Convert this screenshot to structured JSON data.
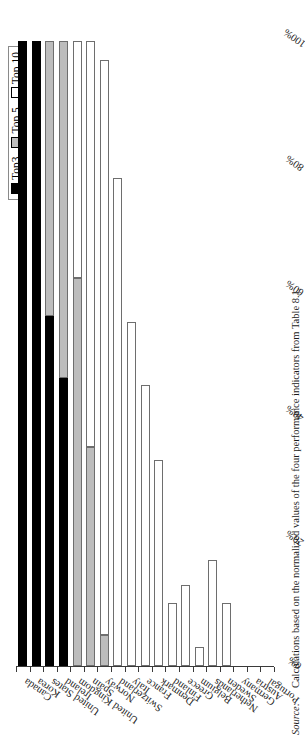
{
  "legend": {
    "items": [
      {
        "label": "Top3",
        "color": "#000000",
        "style": "black"
      },
      {
        "label": "Top 5",
        "color": "#bdbdbd",
        "style": "gray"
      },
      {
        "label": "Top 10",
        "color": "#ffffff",
        "style": "white"
      }
    ]
  },
  "source": {
    "label": "Source:",
    "text": "Calculations based on the normalized values of the four performance indicators from Table 8.1."
  },
  "chart_data": {
    "type": "bar",
    "orientation": "horizontal-stacked",
    "title": "",
    "xlabel": "",
    "ylabel": "",
    "xlim": [
      0,
      100
    ],
    "xticks": [
      0,
      20,
      40,
      60,
      80,
      100
    ],
    "xticklabels": [
      "0%",
      "20%",
      "40%",
      "60%",
      "80%",
      "100%"
    ],
    "grid": false,
    "legend_position": "top-right",
    "categories": [
      "Canada",
      "Korea",
      "United States",
      "Ireland",
      "United Kingdom",
      "Spain",
      "Norway",
      "Switzerland",
      "Italy",
      "France",
      "Denmark",
      "Finland",
      "Greece",
      "Belgium",
      "Netherlands",
      "Sweden",
      "Germany",
      "Austria",
      "Portugal"
    ],
    "series": [
      {
        "name": "Top3",
        "color": "#000000",
        "values": [
          100,
          100,
          56,
          46,
          0,
          0,
          0,
          0,
          0,
          0,
          0,
          0,
          0,
          0,
          0,
          0,
          0,
          0,
          0
        ]
      },
      {
        "name": "Top 5",
        "color": "#bdbdbd",
        "values": [
          0,
          0,
          44,
          54,
          62,
          35,
          5,
          0,
          0,
          0,
          0,
          0,
          0,
          0,
          0,
          0,
          0,
          0,
          0
        ]
      },
      {
        "name": "Top 10",
        "color": "#ffffff",
        "values": [
          0,
          0,
          0,
          0,
          38,
          65,
          92,
          78,
          55,
          45,
          33,
          10,
          13,
          3,
          17,
          10,
          0,
          0,
          0
        ]
      }
    ]
  }
}
